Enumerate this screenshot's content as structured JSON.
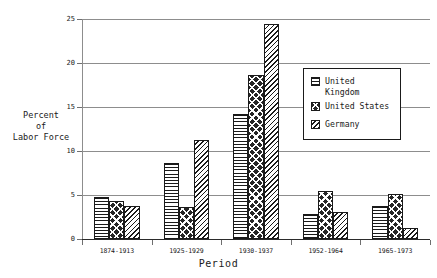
{
  "chart_data": {
    "type": "bar",
    "title": "",
    "xlabel": "Period",
    "ylabel": "Percent\nof\nLabor Force",
    "ylabel_lines": [
      "Percent",
      "of",
      "Labor Force"
    ],
    "categories": [
      "1874-1913",
      "1925-1929",
      "1930-1937",
      "1952-1964",
      "1965-1973"
    ],
    "series": [
      {
        "name": "United Kingdom",
        "pattern": "horizontal-lines",
        "values": [
          4.8,
          8.6,
          14.2,
          2.8,
          3.7
        ]
      },
      {
        "name": "United States",
        "pattern": "checkerboard",
        "values": [
          4.3,
          3.6,
          18.6,
          5.4,
          5.1
        ]
      },
      {
        "name": "Germany",
        "pattern": "diagonal-hatch",
        "values": [
          3.7,
          11.3,
          24.4,
          3.1,
          1.3
        ]
      }
    ],
    "ylim": [
      0,
      25
    ],
    "yticks": [
      0,
      5,
      10,
      15,
      20,
      25
    ],
    "ytick_labels": [
      "0",
      "5",
      "10",
      "15",
      "20",
      "25"
    ],
    "grid": true,
    "grid_axis": "y",
    "legend_position": "upper right",
    "legend_entries": [
      {
        "label_line1": "United",
        "label_line2": "Kingdom"
      },
      {
        "label_line1": "United States",
        "label_line2": ""
      },
      {
        "label_line1": "Germany",
        "label_line2": ""
      }
    ],
    "colors": {
      "ink": "#1a1a1a",
      "grid": "#8d8d8d",
      "background": "#ffffff",
      "fill_dark": "#262626"
    }
  }
}
